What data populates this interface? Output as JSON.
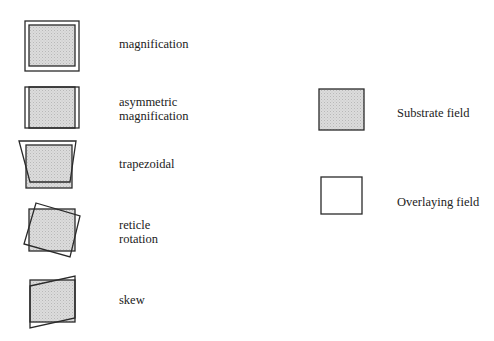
{
  "colors": {
    "substrate_fill": "#d6d6d6",
    "overlay_fill": "none",
    "stroke": "#2a2a2a"
  },
  "error_types": [
    {
      "id": "magnification",
      "label": "magnification",
      "lines": [
        "magnification"
      ]
    },
    {
      "id": "asymmetric-magnification",
      "label": "asymmetric magnification",
      "lines": [
        "asymmetric",
        "magnification"
      ]
    },
    {
      "id": "trapezoidal",
      "label": "trapezoidal",
      "lines": [
        "trapezoidal"
      ]
    },
    {
      "id": "reticle-rotation",
      "label": "reticle rotation",
      "lines": [
        "reticle",
        "rotation"
      ]
    },
    {
      "id": "skew",
      "label": "skew",
      "lines": [
        "skew"
      ]
    }
  ],
  "legend": [
    {
      "id": "substrate-field",
      "label": "Substrate field",
      "filled": true
    },
    {
      "id": "overlaying-field",
      "label": "Overlaying field",
      "filled": false
    }
  ]
}
